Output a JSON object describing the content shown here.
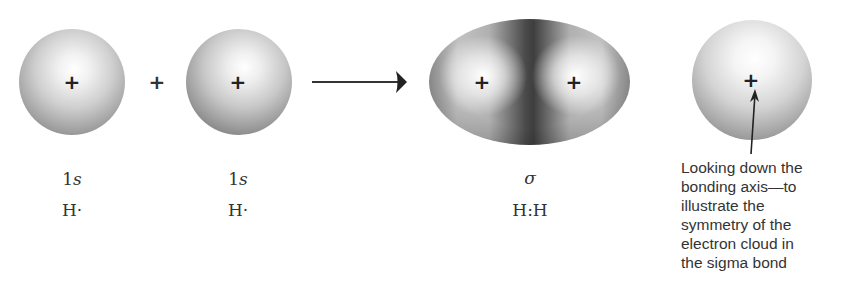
{
  "diagram": {
    "operator_plus": "+",
    "nucleus_symbol": "+",
    "atom1": {
      "orbital": "1s",
      "orbital_num": "1",
      "orbital_letter": "s",
      "species": "H·"
    },
    "atom2": {
      "orbital": "1s",
      "orbital_num": "1",
      "orbital_letter": "s",
      "species": "H·"
    },
    "bond": {
      "orbital": "σ",
      "species": "H:H"
    },
    "end_view": {
      "caption_lines": [
        "Looking down the",
        "bonding axis—to",
        "illustrate the",
        "symmetry of the",
        "electron cloud in",
        "the sigma bond"
      ]
    },
    "colors": {
      "ink": "#333333",
      "cloud_dark": "#3e3e3e",
      "cloud_light": "#ffffff"
    }
  }
}
